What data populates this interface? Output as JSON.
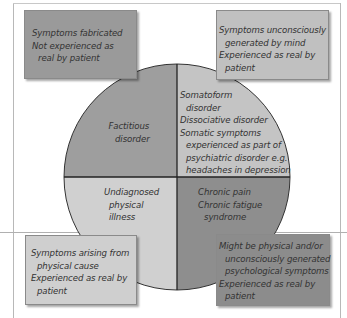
{
  "colors": {
    "factitious": "#9e9e9e",
    "somatoform": "#c4c4c4",
    "undiagnosed": "#d0d0d0",
    "chronic": "#8e8e8e",
    "box_top_left": "#9a9a9a",
    "box_top_right": "#c0c0c0",
    "box_bottom_left": "#cfcfcf",
    "box_bottom_right": "#8c8c8c"
  },
  "quadrants": {
    "top_left": {
      "lines": [
        "Factitious",
        "disorder"
      ]
    },
    "top_right": {
      "lines": [
        "Somatoform",
        "disorder",
        "Dissociative disorder",
        "Somatic symptoms",
        "experienced as part of",
        "psychiatric disorder e.g.",
        "headaches in depression"
      ]
    },
    "bottom_left": {
      "lines": [
        "Undiagnosed",
        "physical",
        "illness"
      ]
    },
    "bottom_right": {
      "lines": [
        "Chronic pain",
        "Chronic fatigue",
        "syndrome"
      ]
    }
  },
  "boxes": {
    "top_left": {
      "lines": [
        "Symptoms fabricated",
        "Not experienced as",
        "real by patient"
      ]
    },
    "top_right": {
      "lines": [
        "Symptoms unconsciously",
        "generated by mind",
        "Experienced as real by",
        "patient"
      ]
    },
    "bottom_left": {
      "lines": [
        "Symptoms arising from",
        "physical cause",
        "Experienced as real by",
        "patient"
      ]
    },
    "bottom_right": {
      "lines": [
        "Might be physical and/or",
        "unconsciously generated",
        "psychological symptoms",
        "Experienced as real by",
        "patient"
      ]
    }
  }
}
